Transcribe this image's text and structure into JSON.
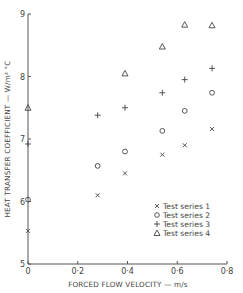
{
  "chart_data": {
    "type": "scatter",
    "title": "",
    "xlabel": "FORCED FLOW VELOCITY — m/s",
    "ylabel": "HEAT TRANSFER COEFFICIENT — W/m² °C",
    "xlim": [
      0,
      0.8
    ],
    "ylim": [
      5,
      9
    ],
    "x_ticks": [
      "0",
      "0·2",
      "0·4",
      "0·6",
      "0·8"
    ],
    "y_ticks": [
      "5",
      "6",
      "7",
      "8",
      "9"
    ],
    "grid": false,
    "legend_position": "lower right",
    "series": [
      {
        "name": "Test series 1",
        "marker": "x",
        "x": [
          0.0,
          0.28,
          0.39,
          0.54,
          0.63,
          0.74
        ],
        "y": [
          5.53,
          6.1,
          6.45,
          6.75,
          6.9,
          7.16
        ]
      },
      {
        "name": "Test series 2",
        "marker": "o",
        "x": [
          0.0,
          0.28,
          0.39,
          0.54,
          0.63,
          0.74
        ],
        "y": [
          6.03,
          6.57,
          6.8,
          7.13,
          7.45,
          7.74
        ]
      },
      {
        "name": "Test series 3",
        "marker": "+",
        "x": [
          0.0,
          0.28,
          0.39,
          0.54,
          0.63,
          0.74
        ],
        "y": [
          6.92,
          7.38,
          7.5,
          7.74,
          7.95,
          8.13
        ]
      },
      {
        "name": "Test series 4",
        "marker": "triangle",
        "x": [
          0.0,
          0.39,
          0.54,
          0.63,
          0.74
        ],
        "y": [
          7.5,
          8.05,
          8.48,
          8.83,
          8.82
        ]
      }
    ]
  },
  "axes": {
    "x_label": "FORCED FLOW VELOCITY — m/s",
    "y_label": "HEAT TRANSFER COEFFICIENT — W/m² °C",
    "x_ticks": [
      "0",
      "0·2",
      "0·4",
      "0·6",
      "0·8"
    ],
    "y_ticks": [
      "5",
      "6",
      "7",
      "8",
      "9"
    ]
  },
  "legend": {
    "items": [
      {
        "label": "Test series 1",
        "marker": "cross-icon"
      },
      {
        "label": "Test series 2",
        "marker": "circle-icon"
      },
      {
        "label": "Test series 3",
        "marker": "plus-icon"
      },
      {
        "label": "Test series 4",
        "marker": "triangle-icon"
      }
    ]
  },
  "colors": {
    "ink": "#444444",
    "background": "#ffffff"
  }
}
